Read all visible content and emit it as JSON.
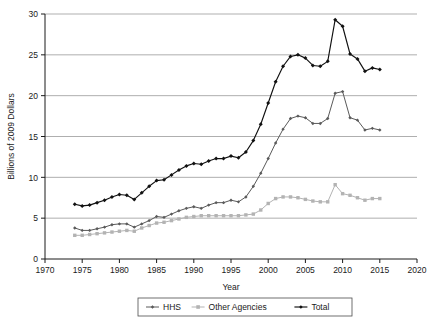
{
  "chart_data": {
    "type": "line",
    "title": "",
    "xlabel": "Year",
    "ylabel": "Billions of 2009 Dollars",
    "xlim": [
      1970,
      2020
    ],
    "ylim": [
      0,
      30
    ],
    "xticks": [
      1970,
      1975,
      1980,
      1985,
      1990,
      1995,
      2000,
      2005,
      2010,
      2015,
      2020
    ],
    "yticks": [
      0,
      5,
      10,
      15,
      20,
      25,
      30
    ],
    "grid": "horizontal",
    "legend_position": "bottom-center",
    "x": [
      1974,
      1975,
      1976,
      1977,
      1978,
      1979,
      1980,
      1981,
      1982,
      1983,
      1984,
      1985,
      1986,
      1987,
      1988,
      1989,
      1990,
      1991,
      1992,
      1993,
      1994,
      1995,
      1996,
      1997,
      1998,
      1999,
      2000,
      2001,
      2002,
      2003,
      2004,
      2005,
      2006,
      2007,
      2008,
      2009,
      2010,
      2011,
      2012,
      2013,
      2014,
      2015
    ],
    "series": [
      {
        "name": "HHS",
        "color": "#5a5a5a",
        "marker": "small-diamond",
        "values": [
          3.8,
          3.5,
          3.5,
          3.7,
          3.9,
          4.2,
          4.3,
          4.3,
          3.9,
          4.3,
          4.7,
          5.2,
          5.1,
          5.5,
          5.9,
          6.2,
          6.4,
          6.2,
          6.6,
          6.9,
          6.9,
          7.2,
          7.0,
          7.6,
          8.9,
          10.5,
          12.3,
          14.2,
          15.9,
          17.2,
          17.5,
          17.3,
          16.6,
          16.6,
          17.2,
          20.3,
          20.5,
          17.3,
          17.0,
          15.8,
          16.0,
          15.8
        ]
      },
      {
        "name": "Other Agencies",
        "color": "#b3b3b3",
        "marker": "small-square",
        "values": [
          2.9,
          2.9,
          3.0,
          3.1,
          3.2,
          3.3,
          3.4,
          3.5,
          3.4,
          3.8,
          4.1,
          4.4,
          4.5,
          4.7,
          4.9,
          5.1,
          5.2,
          5.3,
          5.3,
          5.3,
          5.3,
          5.3,
          5.3,
          5.4,
          5.5,
          6.0,
          6.8,
          7.4,
          7.6,
          7.6,
          7.5,
          7.3,
          7.1,
          7.0,
          7.0,
          9.1,
          8.0,
          7.8,
          7.5,
          7.2,
          7.4,
          7.4
        ]
      },
      {
        "name": "Total",
        "color": "#111111",
        "marker": "diamond",
        "values": [
          6.7,
          6.5,
          6.6,
          6.9,
          7.2,
          7.6,
          7.9,
          7.8,
          7.3,
          8.1,
          8.9,
          9.6,
          9.7,
          10.3,
          10.9,
          11.4,
          11.7,
          11.6,
          12.0,
          12.3,
          12.3,
          12.6,
          12.4,
          13.1,
          14.5,
          16.5,
          19.1,
          21.7,
          23.6,
          24.8,
          25.0,
          24.6,
          23.7,
          23.6,
          24.2,
          29.3,
          28.5,
          25.1,
          24.5,
          23.0,
          23.4,
          23.2
        ]
      }
    ]
  },
  "legend": {
    "items": [
      {
        "label": "HHS"
      },
      {
        "label": "Other Agencies"
      },
      {
        "label": "Total"
      }
    ]
  }
}
